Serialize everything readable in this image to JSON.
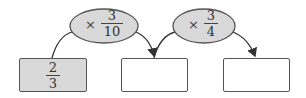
{
  "diagram": {
    "start_box": {
      "numerator": "2",
      "denominator": "3",
      "fill": "#d9d9d9"
    },
    "operations": [
      {
        "symbol": "×",
        "numerator": "3",
        "denominator": "10"
      },
      {
        "symbol": "×",
        "numerator": "3",
        "denominator": "4"
      }
    ],
    "result_boxes": [
      {
        "value": ""
      },
      {
        "value": ""
      }
    ],
    "colors": {
      "ellipse_fill": "#d9d9d9",
      "stroke": "#555555",
      "box_fill_empty": "#ffffff"
    }
  }
}
